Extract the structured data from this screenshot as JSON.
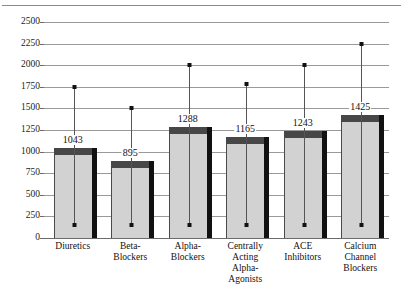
{
  "chart_data": {
    "type": "bar",
    "title": "",
    "subtitle": "",
    "xlabel": "",
    "ylabel": "",
    "ylim": [
      0,
      2500
    ],
    "ytick_step": 250,
    "yticks": [
      "0",
      "250",
      "500",
      "750",
      "1000",
      "1250",
      "1500",
      "1750",
      "2000",
      "2250",
      "2500"
    ],
    "grid": true,
    "legend": "none",
    "style": "3d-column-with-error-bars",
    "categories": [
      "Diuretics",
      "Beta-Blockers",
      "Alpha-Blockers",
      "Centrally Acting Alpha-Agonists",
      "ACE Inhibitors",
      "Calcium Channel Blockers"
    ],
    "category_label_lines": [
      [
        "Diuretics"
      ],
      [
        "Beta-",
        "Blockers"
      ],
      [
        "Alpha-",
        "Blockers"
      ],
      [
        "Centrally",
        "Acting",
        "Alpha-",
        "Agonists"
      ],
      [
        "ACE",
        "Inhibitors"
      ],
      [
        "Calcium",
        "Channel",
        "Blockers"
      ]
    ],
    "values": [
      1043,
      895,
      1288,
      1165,
      1243,
      1425
    ],
    "data_labels": [
      "1043",
      "895",
      "1288",
      "1165",
      "1243",
      "1425"
    ],
    "error_high": [
      1750,
      1500,
      2000,
      1780,
      2000,
      2250
    ],
    "error_low": [
      150,
      150,
      150,
      150,
      150,
      150
    ]
  },
  "colors": {
    "bar_front": "#d2d2d2",
    "bar_top": "#474747",
    "bar_side": "#111111",
    "gridline": "#9a9a9a",
    "axis": "#6b6b6b",
    "text": "#111111",
    "background": "#ffffff",
    "error_bar": "#555555",
    "error_cap": "#111111"
  }
}
